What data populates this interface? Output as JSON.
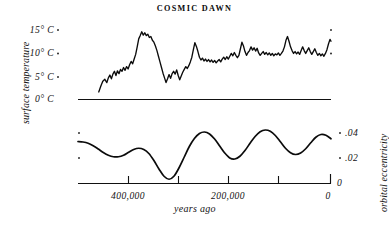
{
  "title": "COSMIC DAWN",
  "axes": {
    "left_title": "surface temperature",
    "right_title": "orbital eccentricity",
    "bottom_title": "years ago",
    "temp_ticks": [
      "15° C",
      "10° C",
      "5° C",
      "0° C"
    ],
    "ecc_ticks": [
      ".04",
      ".02",
      "0"
    ],
    "x_ticks": [
      "400,000",
      "200,000",
      "0"
    ],
    "x_axis_zero": "0"
  },
  "chart_data": {
    "type": "line",
    "title": "COSMIC DAWN",
    "xlabel": "years ago",
    "grid": false,
    "legend": "none",
    "xlim": [
      500000,
      0
    ],
    "x_tick_values": [
      400000,
      300000,
      200000,
      100000,
      0
    ],
    "x_tick_labels": [
      "400,000",
      "",
      "200,000",
      "",
      "0"
    ],
    "panels": [
      {
        "name": "surface temperature",
        "ylabel": "surface temperature",
        "yunit": "° C",
        "ylim": [
          0,
          16
        ],
        "y_tick_values": [
          15,
          10,
          5,
          0
        ],
        "y_tick_labels": [
          "15° C",
          "10° C",
          "5° C",
          "0° C"
        ],
        "baseline_at": 0,
        "style": "jagged proxy record",
        "series": [
          {
            "name": "surface temperature",
            "color": "#0b0b0b",
            "x": [
              459000,
              455000,
              451000,
              447000,
              443000,
              440000,
              437000,
              434000,
              431000,
              428000,
              425000,
              422000,
              419000,
              416000,
              413000,
              410000,
              407000,
              404000,
              401000,
              398000,
              395000,
              392000,
              389000,
              386000,
              383000,
              380000,
              377000,
              374000,
              371000,
              368000,
              365000,
              362000,
              359000,
              356000,
              353000,
              350000,
              347000,
              344000,
              341000,
              338000,
              335000,
              332000,
              329000,
              326000,
              323000,
              320000,
              317000,
              314000,
              311000,
              308000,
              305000,
              302000,
              299000,
              296000,
              293000,
              290000,
              287000,
              284000,
              281000,
              278000,
              275000,
              272000,
              269000,
              266000,
              263000,
              260000,
              257000,
              254000,
              251000,
              248000,
              245000,
              242000,
              239000,
              236000,
              233000,
              230000,
              227000,
              224000,
              221000,
              218000,
              215000,
              212000,
              209000,
              206000,
              203000,
              200000,
              197000,
              194000,
              191000,
              188000,
              185000,
              182000,
              179000,
              176000,
              173000,
              170000,
              167000,
              164000,
              161000,
              158000,
              155000,
              152000,
              149000,
              146000,
              143000,
              140000,
              137000,
              134000,
              131000,
              128000,
              125000,
              122000,
              119000,
              116000,
              113000,
              110000,
              107000,
              104000,
              101000,
              98000,
              95000,
              92000,
              89000,
              86000,
              83000,
              80000,
              77000,
              74000,
              71000,
              68000,
              65000,
              62000,
              59000,
              56000,
              53000,
              50000,
              47000,
              44000,
              41000,
              38000,
              35000,
              32000,
              29000,
              26000,
              23000,
              20000,
              17000,
              14000,
              11000,
              8000,
              5000,
              2000,
              0
            ],
            "y": [
              1.6,
              2.8,
              3.9,
              4.3,
              3.6,
              4.6,
              5.2,
              4.4,
              5.4,
              6.0,
              5.1,
              6.1,
              5.5,
              6.4,
              6.0,
              6.8,
              6.2,
              7.0,
              6.5,
              7.4,
              8.1,
              7.6,
              8.6,
              9.6,
              11.2,
              12.9,
              13.6,
              14.4,
              13.7,
              14.2,
              13.6,
              13.9,
              13.2,
              13.4,
              12.6,
              12.2,
              11.4,
              10.4,
              9.2,
              8.0,
              6.8,
              5.6,
              4.6,
              3.6,
              4.4,
              5.3,
              4.5,
              5.5,
              6.0,
              5.4,
              6.3,
              5.1,
              4.2,
              5.0,
              5.8,
              6.4,
              7.0,
              6.6,
              7.2,
              8.0,
              9.0,
              10.6,
              12.1,
              11.3,
              10.2,
              9.0,
              8.4,
              8.8,
              8.2,
              8.6,
              8.1,
              8.5,
              8.0,
              8.4,
              7.9,
              8.3,
              7.8,
              8.2,
              8.5,
              8.0,
              8.6,
              9.0,
              8.5,
              9.1,
              8.6,
              9.2,
              9.8,
              9.3,
              10.0,
              9.4,
              8.9,
              9.4,
              10.8,
              12.2,
              11.4,
              10.2,
              9.4,
              10.0,
              10.4,
              11.2,
              10.5,
              11.0,
              10.3,
              10.9,
              9.9,
              9.4,
              9.8,
              10.2,
              9.6,
              10.0,
              9.5,
              9.9,
              9.4,
              9.8,
              9.3,
              9.7,
              9.5,
              9.9,
              9.4,
              9.8,
              10.3,
              11.2,
              12.6,
              13.4,
              12.4,
              11.2,
              10.4,
              9.8,
              10.2,
              9.7,
              10.1,
              9.6,
              10.4,
              11.2,
              10.4,
              9.8,
              10.4,
              11.0,
              10.2,
              9.6,
              10.2,
              10.8,
              10.0,
              9.4,
              9.8,
              9.3,
              9.7,
              9.2,
              9.8,
              10.6,
              11.8,
              12.8,
              12.4
            ]
          }
        ]
      },
      {
        "name": "orbital eccentricity",
        "ylabel": "orbital eccentricity",
        "ylim": [
          0,
          0.048
        ],
        "y_tick_values": [
          0.04,
          0.02,
          0
        ],
        "y_tick_labels": [
          ".04",
          ".02",
          "0"
        ],
        "baseline_at": 0,
        "style": "smooth cyclical curve",
        "series": [
          {
            "name": "orbital eccentricity",
            "color": "#0b0b0b",
            "x": [
              500000,
              490000,
              480000,
              470000,
              460000,
              450000,
              440000,
              430000,
              420000,
              410000,
              400000,
              390000,
              380000,
              370000,
              360000,
              350000,
              340000,
              330000,
              320000,
              310000,
              300000,
              290000,
              280000,
              270000,
              260000,
              250000,
              240000,
              230000,
              220000,
              210000,
              200000,
              190000,
              180000,
              170000,
              160000,
              150000,
              140000,
              130000,
              120000,
              110000,
              100000,
              90000,
              80000,
              70000,
              60000,
              50000,
              40000,
              30000,
              20000,
              10000,
              0
            ],
            "y": [
              0.0336,
              0.0332,
              0.0322,
              0.0302,
              0.0276,
              0.0248,
              0.0226,
              0.0214,
              0.0214,
              0.0226,
              0.025,
              0.0272,
              0.0282,
              0.0272,
              0.024,
              0.0184,
              0.0116,
              0.0058,
              0.0034,
              0.006,
              0.0128,
              0.0212,
              0.0296,
              0.036,
              0.04,
              0.0412,
              0.0396,
              0.0356,
              0.03,
              0.0244,
              0.0204,
              0.0196,
              0.0218,
              0.0264,
              0.0322,
              0.0376,
              0.0414,
              0.0428,
              0.0418,
              0.0384,
              0.0334,
              0.0282,
              0.0246,
              0.0232,
              0.0244,
              0.0278,
              0.0326,
              0.037,
              0.0392,
              0.0386,
              0.0358
            ]
          }
        ]
      }
    ]
  },
  "colors": {
    "ink": "#0b0b0b",
    "paper": "#ffffff"
  }
}
